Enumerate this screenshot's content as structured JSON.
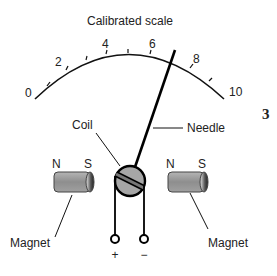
{
  "diagram": {
    "title": "Calibrated scale",
    "figure_number": "3",
    "scale": {
      "ticks": [
        "0",
        "2",
        "4",
        "6",
        "8",
        "10"
      ],
      "needle_reading": 7.2
    },
    "labels": {
      "coil": "Coil",
      "needle": "Needle",
      "magnet_left": "Magnet",
      "magnet_right": "Magnet"
    },
    "magnets": [
      {
        "north": "N",
        "south": "S"
      },
      {
        "north": "N",
        "south": "S"
      }
    ],
    "terminals": {
      "positive": "+",
      "negative": "−"
    },
    "colors": {
      "magnet_body": "#9a9a9a",
      "coil_fill": "#a8a8a8",
      "stroke": "#111111"
    }
  }
}
